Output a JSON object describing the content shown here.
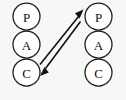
{
  "diagram": {
    "background_color": "#f7f7f5",
    "stroke_color": "#111111",
    "node_fill_color": "#ffffff",
    "width": 126,
    "height": 100,
    "columns": [
      {
        "id": "left-agent",
        "name": "left-pac-agent",
        "cx": 26.5,
        "nodes": [
          {
            "id": "left-p",
            "label": "P",
            "role": "presentation",
            "cx": 26.5,
            "cy": 16.5,
            "r": 13.5
          },
          {
            "id": "left-a",
            "label": "A",
            "role": "abstraction",
            "cx": 26.5,
            "cy": 44.5,
            "r": 13.5
          },
          {
            "id": "left-c",
            "label": "C",
            "role": "control",
            "cx": 26.5,
            "cy": 72.5,
            "r": 13.5
          }
        ]
      },
      {
        "id": "right-agent",
        "name": "right-pac-agent",
        "cx": 98.5,
        "nodes": [
          {
            "id": "right-p",
            "label": "P",
            "role": "presentation",
            "cx": 98.5,
            "cy": 16.5,
            "r": 13.5
          },
          {
            "id": "right-a",
            "label": "A",
            "role": "abstraction",
            "cx": 98.5,
            "cy": 44.5,
            "r": 13.5
          },
          {
            "id": "right-c",
            "label": "C",
            "role": "control",
            "cx": 98.5,
            "cy": 72.5,
            "r": 13.5
          }
        ]
      }
    ],
    "edges": [
      {
        "id": "edge-up",
        "name": "arrow-control-to-presentation",
        "from": "left-c",
        "to": "right-p",
        "direction": "up-right",
        "shaft": {
          "x1": 40.0,
          "y1": 64.0,
          "x2": 78.0,
          "y2": 16.0
        },
        "head": {
          "tip_x": 83.0,
          "tip_y": 10.0
        }
      },
      {
        "id": "edge-down",
        "name": "arrow-presentation-to-control",
        "from": "right-p",
        "to": "left-c",
        "direction": "down-left",
        "shaft": {
          "x1": 80.0,
          "y1": 22.0,
          "x2": 46.0,
          "y2": 68.0
        },
        "head": {
          "tip_x": 40.5,
          "tip_y": 76.0
        }
      }
    ]
  }
}
